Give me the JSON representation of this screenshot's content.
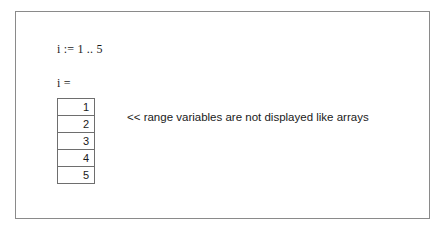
{
  "frame": {
    "border_color": "#8a8a8a",
    "background": "#ffffff"
  },
  "definition": {
    "text": "i := 1 .. 5",
    "variable": "i",
    "assign_operator": ":=",
    "range_start": 1,
    "range_end": 5
  },
  "result": {
    "label": "i =",
    "variable": "i",
    "equals_operator": "=",
    "values": [
      {
        "value": "1"
      },
      {
        "value": "2"
      },
      {
        "value": "3"
      },
      {
        "value": "4"
      },
      {
        "value": "5"
      }
    ]
  },
  "annotation": {
    "text": "<< range variables are not displayed like arrays",
    "marker": "<<"
  }
}
